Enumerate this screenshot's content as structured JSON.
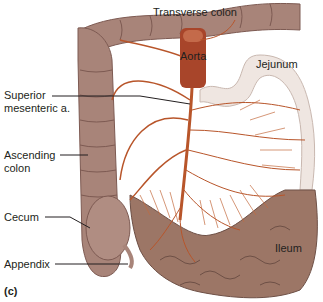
{
  "figure": {
    "panel_label": "(c)"
  },
  "labels": {
    "transverse_colon": "Transverse colon",
    "aorta": "Aorta",
    "jejunum": "Jejunum",
    "superior_mesenteric_line1": "Superior",
    "superior_mesenteric_line2": "mesenteric a.",
    "ascending_colon_line1": "Ascending",
    "ascending_colon_line2": "colon",
    "cecum": "Cecum",
    "appendix": "Appendix",
    "ileum": "Ileum"
  },
  "colors": {
    "colon": "#a88479",
    "colon_shadow": "#7d5a52",
    "artery": "#b8552a",
    "aorta": "#a8452a",
    "jejunum": "#efe6e1",
    "ileum": "#9c7666",
    "ileum_light": "#d9c6bc",
    "text": "#231f20"
  }
}
